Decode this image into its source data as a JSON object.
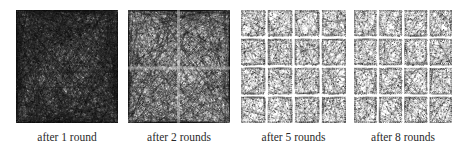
{
  "figure": {
    "panels": [
      {
        "id": "p1",
        "caption": "after 1 round",
        "grid": 1,
        "density": 1.0,
        "x": 16,
        "w": 102
      },
      {
        "id": "p2",
        "caption": "after 2 rounds",
        "grid": 2,
        "density": 0.72,
        "x": 128,
        "w": 102
      },
      {
        "id": "p3",
        "caption": "after 5 rounds",
        "grid": 4,
        "density": 0.78,
        "x": 241,
        "w": 105
      },
      {
        "id": "p4",
        "caption": "after 8 rounds",
        "grid": 4,
        "density": 0.8,
        "x": 354,
        "w": 98
      }
    ],
    "colors": {
      "ink": "#1a1a1a",
      "background": "#ffffff"
    }
  }
}
